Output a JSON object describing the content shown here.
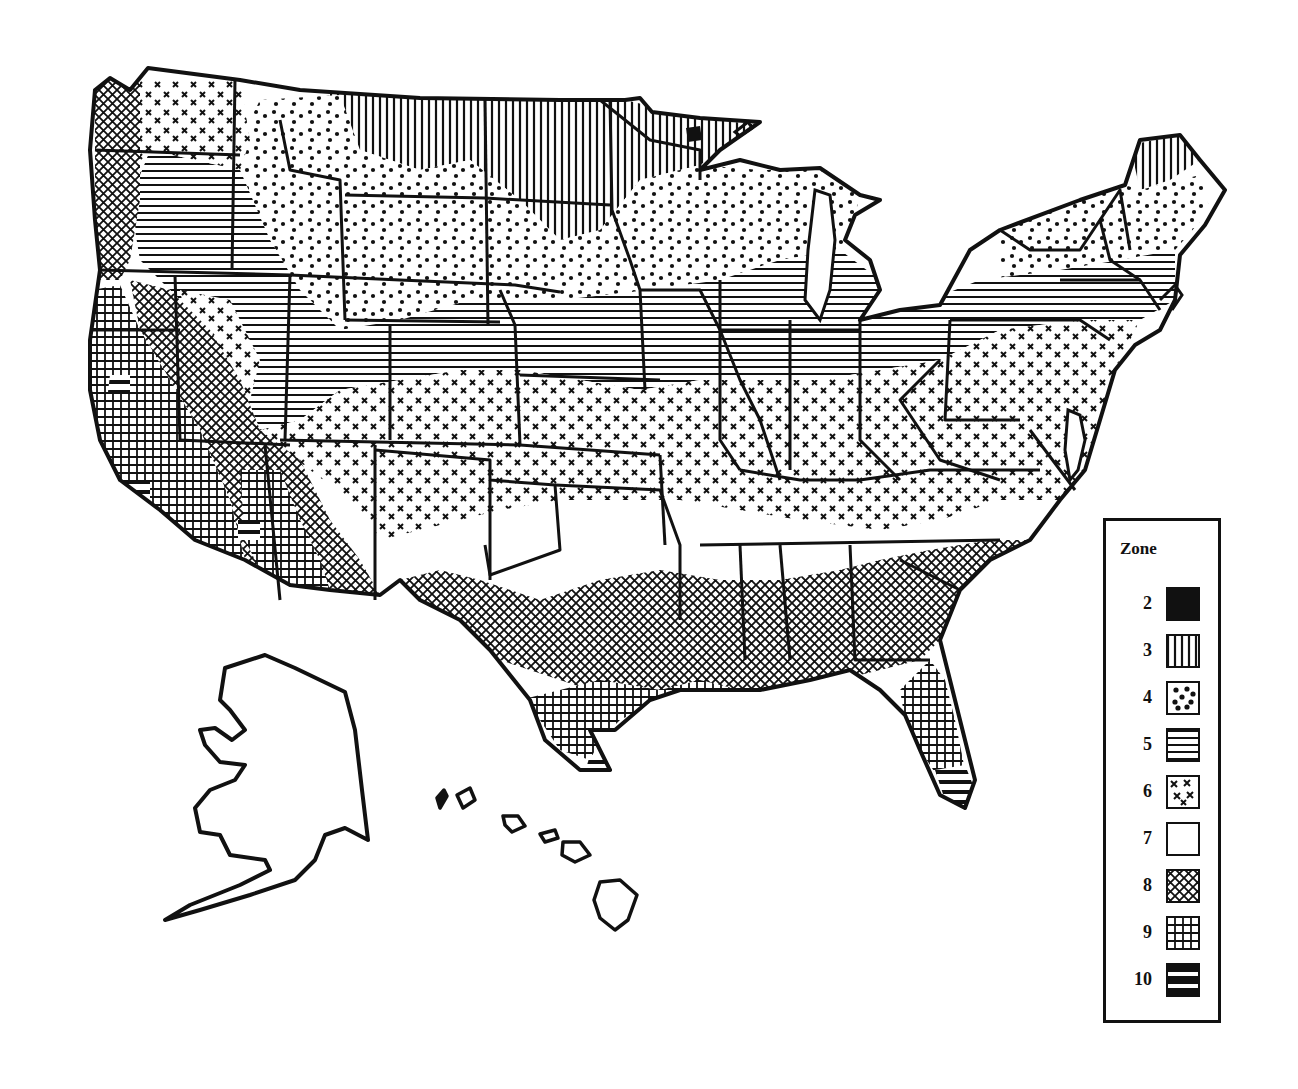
{
  "map": {
    "title": "Plant Hardiness Zone Map of the United States",
    "style": "black-and-white hatched zone map",
    "regions_shown": [
      "Contiguous United States",
      "Alaska (outline only)",
      "Hawaii (outline only)"
    ],
    "ink_color": "#111111",
    "background_color": "#ffffff"
  },
  "legend": {
    "title": "Zone",
    "items": [
      {
        "zone": "2",
        "pattern": "solid-black"
      },
      {
        "zone": "3",
        "pattern": "vertical-lines"
      },
      {
        "zone": "4",
        "pattern": "dots"
      },
      {
        "zone": "5",
        "pattern": "horizontal-lines"
      },
      {
        "zone": "6",
        "pattern": "x-marks"
      },
      {
        "zone": "7",
        "pattern": "blank-white"
      },
      {
        "zone": "8",
        "pattern": "diagonal-crosshatch"
      },
      {
        "zone": "9",
        "pattern": "grid-crosshatch"
      },
      {
        "zone": "10",
        "pattern": "thick-horizontal-bars"
      }
    ]
  }
}
